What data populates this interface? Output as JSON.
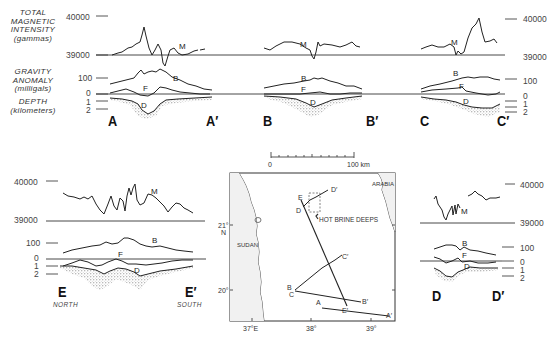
{
  "axis_labels": {
    "magnetic": [
      "TOTAL",
      "MAGNETIC",
      "INTENSITY",
      "(gammas)"
    ],
    "gravity": [
      "GRAVITY",
      "ANOMALY",
      "(milligals)"
    ],
    "depth": [
      "DEPTH",
      "(kilometers)"
    ]
  },
  "ticks": {
    "mag_high": "40000",
    "mag_low": "39000",
    "grav_100": "100",
    "grav_0": "0",
    "depth_1": "1",
    "depth_2": "2"
  },
  "curve_labels": {
    "magnetic": "M",
    "gravity_bouguer": "B",
    "gravity_free_air": "F",
    "depth": "D"
  },
  "profiles": [
    {
      "id": "A",
      "start": "A",
      "end": "A′"
    },
    {
      "id": "B",
      "start": "B",
      "end": "B′"
    },
    {
      "id": "C",
      "start": "C",
      "end": "C′"
    },
    {
      "id": "D",
      "start": "D",
      "end": "D′"
    },
    {
      "id": "E",
      "start": "E",
      "end": "E′",
      "start_dir": "NORTH",
      "end_dir": "SOUTH"
    }
  ],
  "map": {
    "scale_start": "0",
    "scale_end": "100 km",
    "lat_labels": [
      "21°",
      "N",
      "20°"
    ],
    "lon_labels": [
      "37°E",
      "38°",
      "39°"
    ],
    "regions": [
      "SUDAN",
      "ARABIA"
    ],
    "feature": "HOT BRINE DEEPS",
    "track_labels": [
      "A",
      "A′",
      "B",
      "B′",
      "C",
      "C′",
      "D",
      "D′",
      "E",
      "E′"
    ]
  }
}
